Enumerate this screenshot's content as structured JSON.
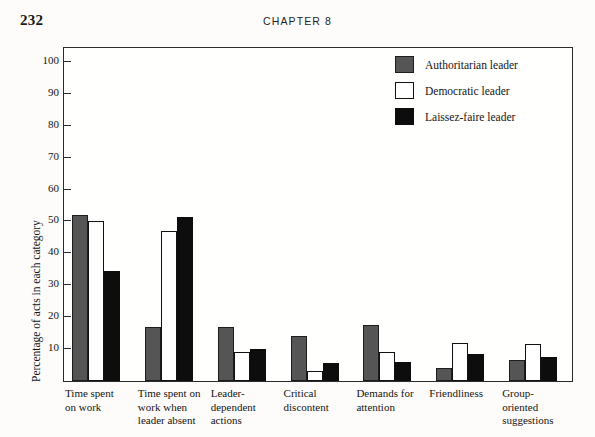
{
  "page": {
    "number": "232",
    "running_head": "CHAPTER 8"
  },
  "colors": {
    "authoritarian": "#555555",
    "democratic": "#ffffff",
    "laissez_faire": "#0d0d0d",
    "frame": "#2b2b2b",
    "text": "#141414",
    "background": "#fdfcfa"
  },
  "legend": {
    "position": "top-right",
    "items": [
      {
        "label": "Authoritarian leader",
        "swatch": "authoritarian"
      },
      {
        "label": "Democratic leader",
        "swatch": "democratic"
      },
      {
        "label": "Laissez-faire leader",
        "swatch": "laissez_faire"
      }
    ]
  },
  "chart_data": {
    "type": "bar",
    "title": "",
    "subtitle": "",
    "xlabel": "",
    "ylabel": "Percentage of acts in each category",
    "ylim": [
      0,
      105
    ],
    "yticks": [
      10,
      20,
      30,
      40,
      50,
      60,
      70,
      80,
      90,
      100
    ],
    "ytick_labels": [
      "10",
      "20",
      "30",
      "40",
      "50",
      "60",
      "70",
      "80",
      "90",
      "100"
    ],
    "grid": false,
    "legend_position": "top-right",
    "categories": [
      "Time spent on work",
      "Time spent on work when leader absent",
      "Leader-dependent actions",
      "Critical discontent",
      "Demands for attention",
      "Friendliness",
      "Group-oriented suggestions"
    ],
    "category_lines": [
      [
        "Time spent",
        "on work"
      ],
      [
        "Time spent on",
        "work when",
        "leader absent"
      ],
      [
        "Leader-",
        "dependent",
        "actions"
      ],
      [
        "Critical",
        "discontent"
      ],
      [
        "Demands for",
        "attention"
      ],
      [
        "Friendliness"
      ],
      [
        "Group-",
        "oriented",
        "suggestions"
      ]
    ],
    "series": [
      {
        "name": "Authoritarian leader",
        "color": "#555555",
        "values": [
          52,
          17,
          17,
          14,
          17.5,
          4,
          6.5
        ]
      },
      {
        "name": "Democratic leader",
        "color": "#ffffff",
        "values": [
          50,
          47,
          9,
          3,
          9,
          12,
          11.5
        ]
      },
      {
        "name": "Laissez-faire leader",
        "color": "#0d0d0d",
        "values": [
          34.5,
          51.5,
          10,
          5.5,
          6,
          8.5,
          7.5
        ]
      }
    ]
  }
}
